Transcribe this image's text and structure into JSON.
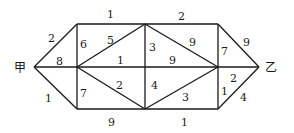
{
  "diagram": {
    "type": "weighted-graph",
    "nodes": {
      "start": {
        "label": "甲"
      },
      "end": {
        "label": "乙"
      }
    },
    "edges": [
      {
        "name": "start-to-topleft",
        "weight": "2"
      },
      {
        "name": "start-to-midleft",
        "weight": "8"
      },
      {
        "name": "start-to-bottomleft",
        "weight": "1"
      },
      {
        "name": "topleft-to-midleft",
        "weight": "6"
      },
      {
        "name": "midleft-to-bottomleft",
        "weight": "7"
      },
      {
        "name": "topleft-to-topmid",
        "weight": "1"
      },
      {
        "name": "midleft-to-topmid",
        "weight": "5"
      },
      {
        "name": "midleft-to-midmid",
        "weight": "1"
      },
      {
        "name": "midleft-to-bottommid",
        "weight": "2"
      },
      {
        "name": "bottomleft-to-bottommid",
        "weight": "9"
      },
      {
        "name": "topmid-to-midmid",
        "weight": "3"
      },
      {
        "name": "midmid-to-bottommid",
        "weight": "4"
      },
      {
        "name": "topmid-to-topright",
        "weight": "2"
      },
      {
        "name": "topmid-to-midright",
        "weight": "9"
      },
      {
        "name": "midmid-to-midright",
        "weight": "9"
      },
      {
        "name": "bottommid-to-midright",
        "weight": "3"
      },
      {
        "name": "bottommid-to-bottomright",
        "weight": "1"
      },
      {
        "name": "topright-to-midright",
        "weight": "7"
      },
      {
        "name": "midright-to-bottomright",
        "weight": "1"
      },
      {
        "name": "topright-to-end",
        "weight": "9"
      },
      {
        "name": "midright-to-end",
        "weight": "2"
      },
      {
        "name": "bottomright-to-end",
        "weight": "4"
      }
    ]
  }
}
